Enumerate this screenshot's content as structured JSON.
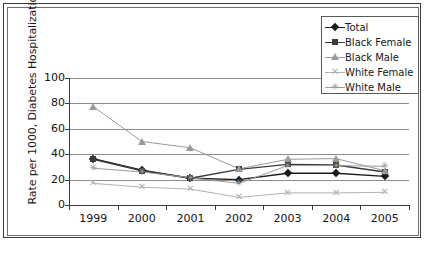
{
  "chart_data": {
    "type": "line",
    "title": "",
    "xlabel": "",
    "ylabel": "Rate per 1000, Diabetes Hospitalizations",
    "categories": [
      "1999",
      "2000",
      "2001",
      "2002",
      "2003",
      "2004",
      "2005"
    ],
    "ylim": [
      0,
      100
    ],
    "yticks": [
      0,
      20,
      40,
      60,
      80,
      100
    ],
    "grid": true,
    "legend_position": "top-right",
    "series": [
      {
        "name": "Total",
        "marker": "diamond",
        "color": "#1b1b1b",
        "values": [
          36.5,
          27.5,
          21.0,
          20.0,
          25.0,
          25.0,
          22.5
        ]
      },
      {
        "name": "Black Female",
        "marker": "square",
        "color": "#3a3a3a",
        "values": [
          36.0,
          27.0,
          21.0,
          28.0,
          32.0,
          31.5,
          26.0
        ]
      },
      {
        "name": "Black Male",
        "marker": "triangle",
        "color": "#9a9a9a",
        "values": [
          77.5,
          50.0,
          45.0,
          28.5,
          36.0,
          36.5,
          27.0
        ]
      },
      {
        "name": "White Female",
        "marker": "x",
        "color": "#b0b0b0",
        "values": [
          17.0,
          14.0,
          12.5,
          6.0,
          9.5,
          9.5,
          10.0
        ]
      },
      {
        "name": "White Male",
        "marker": "star",
        "color": "#9d9d9d",
        "values": [
          29.0,
          26.0,
          21.5,
          17.0,
          31.0,
          31.0,
          30.5
        ]
      }
    ]
  },
  "legend": {
    "items": [
      {
        "label": "Total"
      },
      {
        "label": "Black Female"
      },
      {
        "label": "Black Male"
      },
      {
        "label": "White Female"
      },
      {
        "label": "White Male"
      }
    ]
  },
  "caption": ""
}
